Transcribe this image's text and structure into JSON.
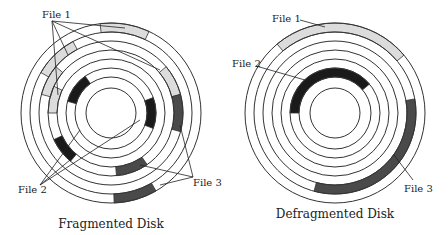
{
  "colors": {
    "file1": "#dcdcdc",
    "file2": "#1a1a1a",
    "file3": "#4a4a4a",
    "ring": "#333333",
    "leader": "#222222"
  },
  "ring_radii": [
    90,
    81,
    72,
    63,
    54,
    45,
    36,
    25
  ],
  "disks": [
    {
      "id": "fragmented",
      "caption": "Fragmented Disk",
      "center": [
        111,
        113
      ],
      "caption_pos": [
        111,
        228
      ],
      "segments": [
        {
          "file": "file1",
          "track": 0,
          "start": -97,
          "end": -65
        },
        {
          "file": "file1",
          "track": 1,
          "start": -150,
          "end": -118
        },
        {
          "file": "file1",
          "track": 2,
          "start": -40,
          "end": -15
        },
        {
          "file": "file1",
          "track": 2,
          "start": -165,
          "end": -140
        },
        {
          "file": "file1",
          "track": 3,
          "start": -180,
          "end": -155
        },
        {
          "file": "file2",
          "track": 5,
          "start": -165,
          "end": -125
        },
        {
          "file": "file2",
          "track": 5,
          "start": -20,
          "end": 20
        },
        {
          "file": "file2",
          "track": 3,
          "start": 130,
          "end": 155
        },
        {
          "file": "file3",
          "track": 2,
          "start": -15,
          "end": 15
        },
        {
          "file": "file3",
          "track": 3,
          "start": 55,
          "end": 85
        },
        {
          "file": "file3",
          "track": 0,
          "start": 60,
          "end": 88
        }
      ],
      "labels": [
        {
          "text": "File 1",
          "x": 42,
          "y": 18,
          "leaders": [
            [
              52,
              21,
              58,
              95
            ],
            [
              52,
              21,
              68,
              55
            ],
            [
              52,
              21,
              160,
              70
            ],
            [
              52,
              21,
              125,
              28
            ]
          ]
        },
        {
          "text": "File 2",
          "x": 18,
          "y": 193,
          "leaders": [
            [
              40,
              185,
              80,
              130
            ],
            [
              40,
              185,
              140,
              120
            ],
            [
              40,
              185,
              70,
              160
            ]
          ]
        },
        {
          "text": "File 3",
          "x": 193,
          "y": 186,
          "leaders": [
            [
              193,
              177,
              180,
              125
            ],
            [
              193,
              177,
              160,
              185
            ],
            [
              193,
              177,
              140,
              165
            ]
          ]
        }
      ]
    },
    {
      "id": "defragmented",
      "caption": "Defragmented Disk",
      "center": [
        335,
        113
      ],
      "caption_pos": [
        335,
        218
      ],
      "segments": [
        {
          "file": "file1",
          "track": 0,
          "start": -130,
          "end": -40
        },
        {
          "file": "file2",
          "track": 5,
          "start": -180,
          "end": -40
        },
        {
          "file": "file3",
          "track": 1,
          "start": -10,
          "end": 105
        }
      ],
      "labels": [
        {
          "text": "File 1",
          "x": 272,
          "y": 22,
          "leaders": [
            [
              300,
              20,
              325,
              27
            ]
          ]
        },
        {
          "text": "File 2",
          "x": 232,
          "y": 67,
          "leaders": [
            [
              256,
              66,
              305,
              80
            ]
          ]
        },
        {
          "text": "File 3",
          "x": 404,
          "y": 192,
          "leaders": [
            [
              413,
              180,
              394,
              155
            ]
          ]
        }
      ]
    }
  ]
}
